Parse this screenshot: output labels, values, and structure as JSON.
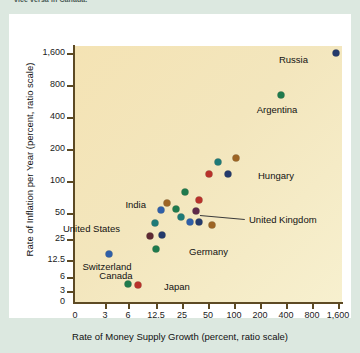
{
  "caption_tail": "vice versa in Canada.",
  "chart_data": {
    "type": "scatter",
    "title": "",
    "xlabel": "Rate of Money Supply Growth (percent, ratio scale)",
    "ylabel": "Rate of Inflation per Year (percent, ratio scale)",
    "xticks": [
      "0",
      "3",
      "6",
      "12.5",
      "25",
      "50",
      "100",
      "200",
      "400",
      "800",
      "1,600"
    ],
    "yticks": [
      "0",
      "3",
      "6",
      "12.5",
      "25",
      "50",
      "100",
      "200",
      "400",
      "800",
      "1,600"
    ],
    "xscale": "log (ratio)",
    "yscale": "log (ratio)",
    "grid": false,
    "legend": "none",
    "plot_background": "#f4e5ba",
    "points": [
      {
        "label": "Russia",
        "x": 1600,
        "y": 1450,
        "color": "#243a6b",
        "px": 327,
        "py": 39,
        "lx": 299,
        "ly": 45,
        "anchor": "right"
      },
      {
        "label": "Argentina",
        "x": 430,
        "y": 330,
        "color": "#1f7a4d",
        "px": 272,
        "py": 81,
        "lx": 268,
        "ly": 95,
        "anchor": "center"
      },
      {
        "label": "",
        "x": 68,
        "y": 46,
        "color": "#1f7a77",
        "px": 209,
        "py": 148,
        "lx": 0,
        "ly": 0,
        "anchor": "none"
      },
      {
        "label": "",
        "x": 115,
        "y": 56,
        "color": "#9c6424",
        "px": 227,
        "py": 144,
        "lx": 0,
        "ly": 0,
        "anchor": "none"
      },
      {
        "label": "",
        "x": 50,
        "y": 30,
        "color": "#b8322b",
        "px": 200,
        "py": 160,
        "lx": 0,
        "ly": 0,
        "anchor": "none"
      },
      {
        "label": "Hungary",
        "x": 72,
        "y": 30,
        "color": "#243a6b",
        "px": 219,
        "py": 160,
        "lx": 249,
        "ly": 161,
        "anchor": "left"
      },
      {
        "label": "",
        "x": 30,
        "y": 21,
        "color": "#1f7a4d",
        "px": 176,
        "py": 178,
        "lx": 0,
        "ly": 0,
        "anchor": "none"
      },
      {
        "label": "",
        "x": 40,
        "y": 18,
        "color": "#b8322b",
        "px": 190,
        "py": 186,
        "lx": 0,
        "ly": 0,
        "anchor": "none"
      },
      {
        "label": "India",
        "x": 17,
        "y": 15,
        "color": "#9c6424",
        "px": 158,
        "py": 189,
        "lx": 137,
        "ly": 190,
        "anchor": "right"
      },
      {
        "label": "",
        "x": 15,
        "y": 13,
        "color": "#2f5fa8",
        "px": 152,
        "py": 196,
        "lx": 0,
        "ly": 0,
        "anchor": "none"
      },
      {
        "label": "",
        "x": 22,
        "y": 14,
        "color": "#1f7a4d",
        "px": 167,
        "py": 195,
        "lx": 0,
        "ly": 0,
        "anchor": "none"
      },
      {
        "label": "United Kingdom",
        "x": 28,
        "y": 13,
        "color": "#5e2a4a",
        "px": 187,
        "py": 197,
        "lx": 240,
        "ly": 205,
        "anchor": "left"
      },
      {
        "label": "",
        "x": 24,
        "y": 12,
        "color": "#1f7a77",
        "px": 172,
        "py": 203,
        "lx": 0,
        "ly": 0,
        "anchor": "none"
      },
      {
        "label": "",
        "x": 30,
        "y": 11,
        "color": "#2f5fa8",
        "px": 181,
        "py": 208,
        "lx": 0,
        "ly": 0,
        "anchor": "none"
      },
      {
        "label": "",
        "x": 34,
        "y": 11,
        "color": "#243a6b",
        "px": 190,
        "py": 208,
        "lx": 0,
        "ly": 0,
        "anchor": "none"
      },
      {
        "label": "",
        "x": 44,
        "y": 10,
        "color": "#9c6424",
        "px": 203,
        "py": 211,
        "lx": 0,
        "ly": 0,
        "anchor": "none"
      },
      {
        "label": "",
        "x": 13,
        "y": 10,
        "color": "#1f7a77",
        "px": 146,
        "py": 209,
        "lx": 0,
        "ly": 0,
        "anchor": "none"
      },
      {
        "label": "United States",
        "x": 9,
        "y": 8,
        "color": "#5e2a33",
        "px": 141,
        "py": 222,
        "lx": 111,
        "ly": 214,
        "anchor": "right"
      },
      {
        "label": "",
        "x": 11,
        "y": 8,
        "color": "#243a6b",
        "px": 153,
        "py": 221,
        "lx": 0,
        "ly": 0,
        "anchor": "none"
      },
      {
        "label": "Germany",
        "x": 10,
        "y": 7,
        "color": "#1f7a4d",
        "px": 147,
        "py": 235,
        "lx": 180,
        "ly": 237,
        "anchor": "left"
      },
      {
        "label": "Switzerland",
        "x": 3.6,
        "y": 6,
        "color": "#2f5fa8",
        "px": 100,
        "py": 240,
        "lx": 98,
        "ly": 252,
        "anchor": "center"
      },
      {
        "label": "Canada",
        "x": 5.2,
        "y": 3.2,
        "color": "#1f7a4d",
        "px": 119,
        "py": 270,
        "lx": 107,
        "ly": 261,
        "anchor": "center"
      },
      {
        "label": "Japan",
        "x": 6.0,
        "y": 3.1,
        "color": "#b8322b",
        "px": 129,
        "py": 271,
        "lx": 155,
        "ly": 272,
        "anchor": "left"
      }
    ]
  }
}
